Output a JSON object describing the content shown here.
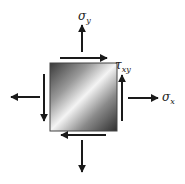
{
  "diagram": {
    "title": "",
    "element": {
      "label": "stress element",
      "fill_gradient": [
        "#3a3a3a",
        "#9a9a9a",
        "#f4f4f4",
        "#8a8a8a",
        "#2e2e2e"
      ]
    },
    "labels": {
      "sigma_y": {
        "symbol": "σ",
        "subscript": "y"
      },
      "tau_xy": {
        "symbol": "τ",
        "subscript": "xy"
      },
      "sigma_x": {
        "symbol": "σ",
        "subscript": "x"
      }
    },
    "arrows": [
      {
        "name": "normal-stress-top",
        "direction": "up"
      },
      {
        "name": "normal-stress-bottom",
        "direction": "down"
      },
      {
        "name": "normal-stress-right",
        "direction": "right"
      },
      {
        "name": "normal-stress-left",
        "direction": "left"
      },
      {
        "name": "shear-top",
        "direction": "right"
      },
      {
        "name": "shear-right",
        "direction": "up"
      },
      {
        "name": "shear-bottom",
        "direction": "left"
      },
      {
        "name": "shear-left",
        "direction": "down"
      }
    ],
    "colors": {
      "arrow": "#1a1a1a",
      "text": "#222222"
    }
  }
}
